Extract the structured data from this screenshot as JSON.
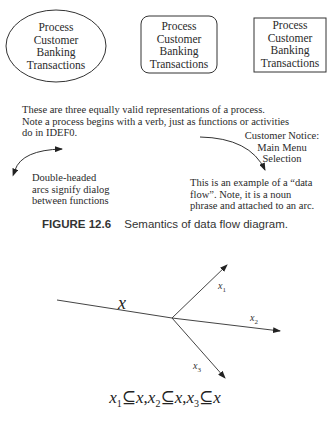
{
  "process_shapes": [
    {
      "shape": "ellipse",
      "lines": [
        "Process",
        "Customer",
        "Banking",
        "Transactions"
      ]
    },
    {
      "shape": "rounded-rectangle",
      "lines": [
        "Process",
        "Customer",
        "Banking",
        "Transactions"
      ]
    },
    {
      "shape": "rectangle",
      "lines": [
        "Process",
        "Customer",
        "Banking",
        "Transactions"
      ]
    }
  ],
  "description": {
    "lines": [
      "These are three equally valid representations of a process.",
      "Note a process begins with a verb, just as functions or activities",
      "do in IDEF0."
    ]
  },
  "dialog_note": {
    "lines": [
      "Double-headed",
      "arcs signify dialog",
      "between functions"
    ]
  },
  "data_flow_label": {
    "lines": [
      "Customer Notice:",
      "Main Menu",
      "Selection"
    ]
  },
  "data_flow_note": {
    "lines": [
      "This is an example of a “data",
      "flow”.  Note, it is a noun",
      "phrase and attached to an arc."
    ]
  },
  "caption": {
    "figure_number": "FIGURE 12.6",
    "text": "Semantics of data flow diagram."
  },
  "split_diagram": {
    "input_label": "x",
    "outputs": [
      {
        "label": "x",
        "sub": "1"
      },
      {
        "label": "x",
        "sub": "2"
      },
      {
        "label": "x",
        "sub": "3"
      }
    ]
  },
  "formula": {
    "parts": [
      {
        "var": "x",
        "sub": "1",
        "op": "⊆",
        "set": "x",
        "sep": ","
      },
      {
        "var": "x",
        "sub": "2",
        "op": "⊆",
        "set": "x",
        "sep": ","
      },
      {
        "var": "x",
        "sub": "3",
        "op": "⊆",
        "set": "x",
        "sep": ""
      }
    ]
  }
}
